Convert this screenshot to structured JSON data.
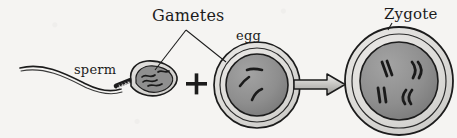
{
  "diagram": {
    "background_color": "#f5f4f2",
    "ink_color": "#1c1c1c",
    "labels": {
      "gametes": "Gametes",
      "egg": "egg",
      "sperm": "sperm",
      "zygote": "Zygote"
    },
    "operators": {
      "plus": "+",
      "arrow": "→"
    },
    "cells": [
      {
        "name": "sperm",
        "label": "sperm",
        "shape": "teardrop-head-with-tail",
        "outer_fill": "#d9d8d6",
        "inner_fill": "#8f8f8f",
        "chromosome_count": 4,
        "parts": [
          "tail",
          "midpiece",
          "head",
          "nucleus"
        ]
      },
      {
        "name": "egg",
        "label": "egg",
        "shape": "circle",
        "outer_fill": "#dedddb",
        "inner_fill": "#909090",
        "chromosome_count": 3,
        "diameter_px": 86
      },
      {
        "name": "zygote",
        "label": "Zygote",
        "shape": "circle",
        "outer_fill": "#dedddb",
        "inner_fill": "#8d8d8d",
        "chromosome_count": 8,
        "chromosome_pairs": 4,
        "diameter_px": 108
      }
    ],
    "leader_lines": [
      {
        "from": "gametes",
        "to": "sperm"
      },
      {
        "from": "gametes",
        "to": "egg"
      },
      {
        "from": "zygote",
        "to": "zygote-cell"
      }
    ]
  }
}
